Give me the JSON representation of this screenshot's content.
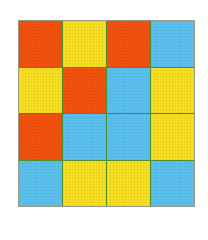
{
  "figure": {
    "name": "colored-square-grid",
    "rows": 4,
    "columns": 4,
    "background_color": "#ffffff",
    "divider_color": "#4e8f2e",
    "border_color": "#9a9a86"
  },
  "palette": {
    "orange": "#f4520e",
    "yellow": "#fae022",
    "blue": "#5bc2f0"
  },
  "chart_data": {
    "type": "heatmap",
    "title": "",
    "xlabel": "",
    "ylabel": "",
    "categories": [
      "1",
      "2",
      "3",
      "4"
    ],
    "row_labels": [
      "1",
      "2",
      "3",
      "4"
    ],
    "legend": [
      {
        "label": "orange",
        "color": "#f4520e"
      },
      {
        "label": "yellow",
        "color": "#fae022"
      },
      {
        "label": "blue",
        "color": "#5bc2f0"
      }
    ],
    "grid": true,
    "cells": [
      [
        {
          "row": 1,
          "col": 1,
          "color_name": "orange",
          "color": "#f4520e"
        },
        {
          "row": 1,
          "col": 2,
          "color_name": "yellow",
          "color": "#fae022"
        },
        {
          "row": 1,
          "col": 3,
          "color_name": "orange",
          "color": "#f4520e"
        },
        {
          "row": 1,
          "col": 4,
          "color_name": "blue",
          "color": "#5bc2f0"
        }
      ],
      [
        {
          "row": 2,
          "col": 1,
          "color_name": "yellow",
          "color": "#fae022"
        },
        {
          "row": 2,
          "col": 2,
          "color_name": "orange",
          "color": "#f4520e"
        },
        {
          "row": 2,
          "col": 3,
          "color_name": "blue",
          "color": "#5bc2f0"
        },
        {
          "row": 2,
          "col": 4,
          "color_name": "yellow",
          "color": "#fae022"
        }
      ],
      [
        {
          "row": 3,
          "col": 1,
          "color_name": "orange",
          "color": "#f4520e"
        },
        {
          "row": 3,
          "col": 2,
          "color_name": "blue",
          "color": "#5bc2f0"
        },
        {
          "row": 3,
          "col": 3,
          "color_name": "blue",
          "color": "#5bc2f0"
        },
        {
          "row": 3,
          "col": 4,
          "color_name": "yellow",
          "color": "#fae022"
        }
      ],
      [
        {
          "row": 4,
          "col": 1,
          "color_name": "blue",
          "color": "#5bc2f0"
        },
        {
          "row": 4,
          "col": 2,
          "color_name": "yellow",
          "color": "#fae022"
        },
        {
          "row": 4,
          "col": 3,
          "color_name": "yellow",
          "color": "#fae022"
        },
        {
          "row": 4,
          "col": 4,
          "color_name": "blue",
          "color": "#5bc2f0"
        }
      ]
    ],
    "counts": {
      "orange": 5,
      "yellow": 6,
      "blue": 5
    }
  }
}
